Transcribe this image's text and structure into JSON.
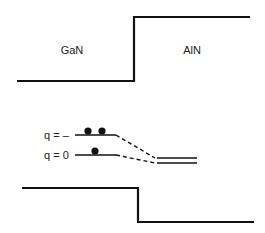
{
  "diagram": {
    "type": "band-alignment",
    "regions": [
      {
        "label": "GaN"
      },
      {
        "label": "AlN"
      }
    ],
    "levels": [
      {
        "label": "q = –",
        "electrons": 2
      },
      {
        "label": "q = 0",
        "electrons": 1
      }
    ],
    "colors": {
      "line": "#111111",
      "text": "#222222",
      "background": "#ffffff"
    }
  }
}
